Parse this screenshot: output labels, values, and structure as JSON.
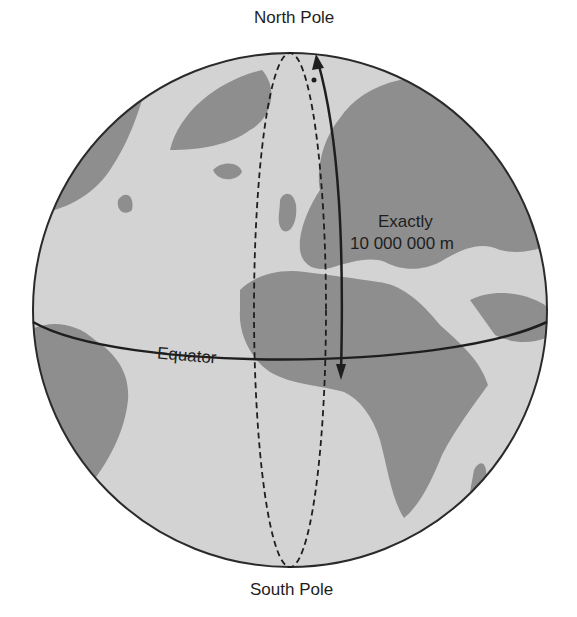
{
  "labels": {
    "north_pole": "North Pole",
    "south_pole": "South Pole",
    "equator": "Equator",
    "distance_line1": "Exactly",
    "distance_line2": "10 000 000 m"
  },
  "colors": {
    "ocean": "#d2d2d2",
    "land": "#8c8c8c",
    "outline": "#2a2a2a",
    "text": "#1e1e1e"
  }
}
